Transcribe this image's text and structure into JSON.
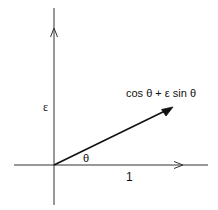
{
  "diagram": {
    "type": "vector-diagram",
    "axes": {
      "vertical_label": "ε",
      "horizontal_tick_label": "1"
    },
    "vector": {
      "label": "cos θ + ε sin θ"
    },
    "angle": {
      "label": "θ"
    },
    "colors": {
      "line": "#111111",
      "axis": "#333333",
      "background": "#ffffff"
    }
  }
}
